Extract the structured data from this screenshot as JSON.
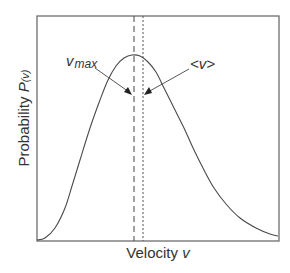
{
  "chart_data": {
    "type": "line",
    "title": "",
    "xlabel": "Velocity v",
    "ylabel": "Probability P(v)",
    "xlabel_parts": {
      "text": "Velocity ",
      "var": "v"
    },
    "ylabel_parts": {
      "text": "Probability ",
      "var": "P",
      "arg": "(v)"
    },
    "x_ticks": [],
    "y_ticks": [],
    "grid": false,
    "legend": null,
    "series": [
      {
        "name": "Maxwell–Boltzmann speed distribution",
        "description": "Right-skewed bell-shaped curve rising from near zero at left, peaking slightly left of center, then decaying with a long tail to the right",
        "points_px": [
          [
            37,
            240
          ],
          [
            45,
            238
          ],
          [
            55,
            228
          ],
          [
            65,
            208
          ],
          [
            72,
            186
          ],
          [
            80,
            160
          ],
          [
            90,
            128
          ],
          [
            100,
            100
          ],
          [
            108,
            80
          ],
          [
            116,
            66
          ],
          [
            124,
            58
          ],
          [
            132,
            55
          ],
          [
            140,
            56
          ],
          [
            148,
            62
          ],
          [
            156,
            72
          ],
          [
            164,
            88
          ],
          [
            174,
            108
          ],
          [
            184,
            128
          ],
          [
            194,
            150
          ],
          [
            204,
            170
          ],
          [
            214,
            188
          ],
          [
            226,
            204
          ],
          [
            240,
            218
          ],
          [
            256,
            228
          ],
          [
            270,
            234
          ],
          [
            278,
            236
          ]
        ]
      }
    ],
    "annotations": [
      {
        "label": "v_max",
        "text": "v",
        "subscript": "max",
        "meaning": "most probable speed",
        "line_style": "long-dash",
        "x_px": 134
      },
      {
        "label": "<v>",
        "text": "<v>",
        "meaning": "mean speed",
        "line_style": "short-dash",
        "x_px": 143
      }
    ],
    "plot_frame_px": {
      "left": 37,
      "top": 16,
      "right": 279,
      "bottom": 241
    }
  },
  "labels": {
    "x_text": "Velocity ",
    "x_var": "v",
    "y_text": "Probability ",
    "y_var": "P",
    "y_arg": "(v)",
    "vmax_main": "v",
    "vmax_sub": "max",
    "mean": "<v>"
  },
  "colors": {
    "frame": "#6e6e6e",
    "curve": "#4a4a4a",
    "text": "#333333",
    "background": "#ffffff"
  }
}
